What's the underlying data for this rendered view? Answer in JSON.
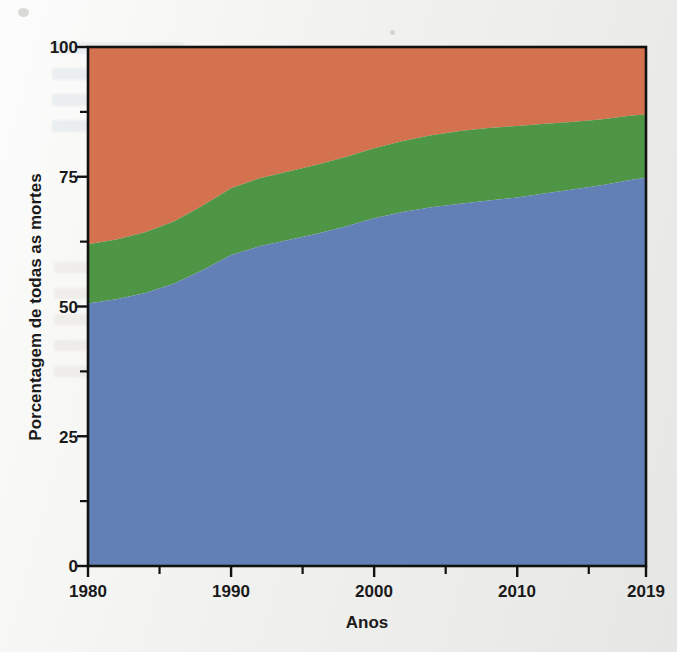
{
  "figure": {
    "background_color": "#efefed",
    "plot_frame_color": "#111111"
  },
  "axes": {
    "y_title": "Porcentagem de todas as mortes",
    "x_title": "Anos",
    "y_ticklabels": [
      "100",
      "75",
      "50",
      "25",
      "0"
    ],
    "x_ticklabels": [
      "1980",
      "1990",
      "2000",
      "2010",
      "2019"
    ]
  },
  "chart_data": {
    "type": "area",
    "stacked": true,
    "normalized_percent": true,
    "title": "",
    "xlabel": "Anos",
    "ylabel": "Porcentagem de todas as mortes",
    "xlim": [
      1980,
      2019
    ],
    "ylim": [
      0,
      100
    ],
    "grid": false,
    "legend_position": "none",
    "y_ticks_major": [
      0,
      25,
      50,
      75,
      100
    ],
    "y_ticks_minor": [
      12.5,
      37.5,
      62.5,
      87.5
    ],
    "x_ticks_major": [
      1980,
      1990,
      2000,
      2010,
      2019
    ],
    "x_ticks_minor": [
      1985,
      1995,
      2005,
      2015
    ],
    "x": [
      1980,
      1982,
      1984,
      1986,
      1988,
      1990,
      1992,
      1994,
      1996,
      1998,
      2000,
      2002,
      2004,
      2006,
      2008,
      2010,
      2012,
      2014,
      2016,
      2018,
      2019
    ],
    "series": [
      {
        "name": "serie-azul",
        "color": "#6280b6",
        "values": [
          50.6,
          51.4,
          52.6,
          54.4,
          57.0,
          59.9,
          61.6,
          62.8,
          64.0,
          65.4,
          67.0,
          68.2,
          69.1,
          69.8,
          70.4,
          71.0,
          71.8,
          72.6,
          73.4,
          74.4,
          74.8
        ]
      },
      {
        "name": "serie-verde",
        "color": "#4f9546",
        "values": [
          11.4,
          11.5,
          11.7,
          12.0,
          12.4,
          12.9,
          13.1,
          13.2,
          13.3,
          13.4,
          13.5,
          13.7,
          13.9,
          14.0,
          14.0,
          13.8,
          13.4,
          13.0,
          12.7,
          12.4,
          12.2
        ]
      },
      {
        "name": "serie-laranja",
        "color": "#d4714f",
        "values": [
          38.0,
          37.1,
          35.7,
          33.6,
          30.6,
          27.2,
          25.3,
          24.0,
          22.7,
          21.2,
          19.5,
          18.1,
          17.0,
          16.2,
          15.6,
          15.2,
          14.8,
          14.4,
          13.9,
          13.2,
          13.0
        ]
      }
    ],
    "cumulative_top_serie_azul": [
      50.6,
      51.4,
      52.6,
      54.4,
      57.0,
      59.9,
      61.6,
      62.8,
      64.0,
      65.4,
      67.0,
      68.2,
      69.1,
      69.8,
      70.4,
      71.0,
      71.8,
      72.6,
      73.4,
      74.4,
      74.8
    ],
    "cumulative_top_serie_verde": [
      62.0,
      62.9,
      64.3,
      66.4,
      69.4,
      72.8,
      74.7,
      76.0,
      77.3,
      78.8,
      80.5,
      81.9,
      83.0,
      83.8,
      84.4,
      84.8,
      85.2,
      85.6,
      86.1,
      86.8,
      87.0
    ]
  }
}
